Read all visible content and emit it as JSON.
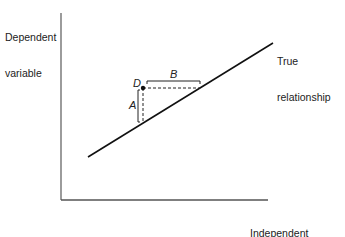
{
  "diagram": {
    "y_axis_label_line1": "Dependent",
    "y_axis_label_line2": "variable",
    "x_axis_label_line1": "Independent",
    "x_axis_label_line2": "variable",
    "line_label_line1": "True",
    "line_label_line2": "relationship",
    "point_label": "D",
    "vertical_distance_label": "A",
    "horizontal_distance_label": "B",
    "colors": {
      "axis": "#555555",
      "line": "#111111",
      "text": "#222222"
    }
  }
}
